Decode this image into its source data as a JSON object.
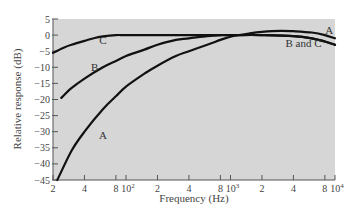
{
  "chart_data": {
    "type": "line",
    "title": "",
    "xlabel": "Frequency (Hz)",
    "ylabel": "Relative response (dB)",
    "xscale": "log",
    "xlim": [
      20,
      10000
    ],
    "ylim": [
      -45,
      5
    ],
    "grid": false,
    "y_ticks": [
      5,
      0,
      -5,
      -10,
      -15,
      -20,
      -25,
      -30,
      -35,
      -40,
      -45
    ],
    "y_tick_labels": [
      "5",
      "0",
      "−5",
      "−10",
      "−15",
      "−20",
      "−25",
      "−30",
      "−35",
      "−40",
      "−45"
    ],
    "x_ticks": [
      20,
      40,
      80,
      100,
      200,
      400,
      800,
      1000,
      2000,
      4000,
      8000,
      10000
    ],
    "x_tick_labels": [
      "2",
      "4",
      "8",
      "10²",
      "2",
      "4",
      "8",
      "10³",
      "2",
      "4",
      "8",
      "10⁴"
    ],
    "series": [
      {
        "name": "A",
        "x": [
          22,
          30,
          40,
          60,
          80,
          100,
          150,
          200,
          300,
          400,
          600,
          800,
          1000,
          1500,
          2000,
          3000,
          4000,
          6000,
          8000,
          10000
        ],
        "y": [
          -45,
          -36,
          -30,
          -23,
          -19,
          -16,
          -12,
          -9.5,
          -6.5,
          -5,
          -3,
          -1.5,
          -0.5,
          0.5,
          1,
          1.3,
          1.2,
          0.8,
          0,
          -1
        ]
      },
      {
        "name": "B",
        "x": [
          24,
          30,
          40,
          60,
          80,
          100,
          150,
          200,
          300,
          400,
          600,
          800,
          1000,
          2000,
          4000,
          6000,
          8000,
          10000
        ],
        "y": [
          -19.5,
          -16.5,
          -13.5,
          -10,
          -8,
          -6.5,
          -4.5,
          -3,
          -1.5,
          -1,
          -0.3,
          0,
          0,
          0,
          -0.3,
          -1,
          -2,
          -3
        ]
      },
      {
        "name": "C",
        "x": [
          20,
          25,
          30,
          40,
          50,
          60,
          80,
          100,
          200,
          400,
          1000,
          2000,
          4000,
          6000,
          8000,
          10000
        ],
        "y": [
          -5.5,
          -4,
          -3,
          -1.8,
          -0.9,
          -0.4,
          0,
          0,
          0,
          0,
          0,
          0,
          -0.3,
          -1,
          -2,
          -3
        ]
      }
    ],
    "annotations": [
      {
        "text": "A",
        "x": 60,
        "y": -31
      },
      {
        "text": "B",
        "x": 50,
        "y": -10
      },
      {
        "text": "C",
        "x": 60,
        "y": -1.5
      },
      {
        "text": "A",
        "x": 8800,
        "y": 1.5
      },
      {
        "text": "B and C",
        "x": 5000,
        "y": -2.5
      }
    ],
    "plot_background": "#d6d6d6",
    "line_color": "#111111"
  }
}
